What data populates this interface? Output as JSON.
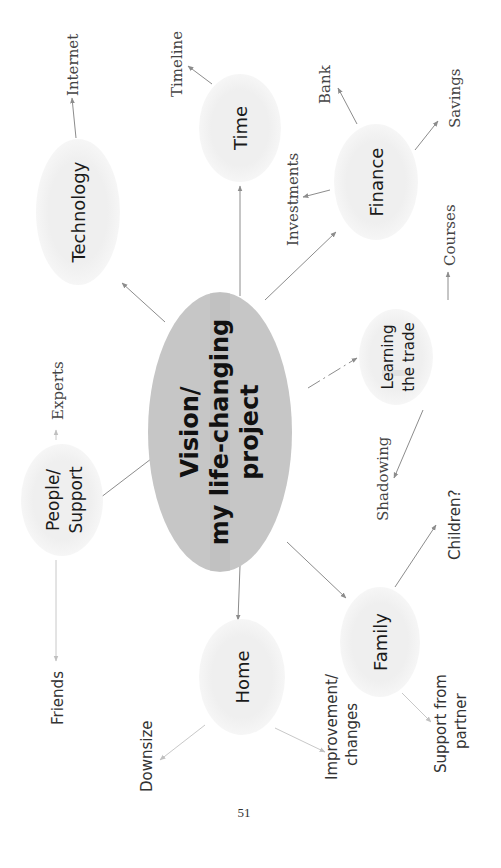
{
  "center": {
    "lines": [
      "Vision/",
      "my life-changing",
      "project"
    ],
    "fill": "#c6c6c6"
  },
  "nodes": {
    "technology": {
      "label": "Technology"
    },
    "time": {
      "label": "Time"
    },
    "finance": {
      "label": "Finance"
    },
    "learning": {
      "lines": [
        "Learning",
        "the trade"
      ]
    },
    "people": {
      "lines": [
        "People/",
        "Support"
      ]
    },
    "home": {
      "label": "Home"
    },
    "family": {
      "label": "Family"
    }
  },
  "leaves": {
    "internet": "Internet",
    "timeline": "Timeline",
    "bank": "Bank",
    "savings": "Savings",
    "investments": "Investments",
    "courses": "Courses",
    "shadowing": "Shadowing",
    "experts": "Experts",
    "friends": "Friends",
    "downsize": "Downsize",
    "improvement": [
      "Improvement/",
      "changes"
    ],
    "support_partner": [
      "Support from",
      "partner"
    ],
    "children": "Children?"
  },
  "colors": {
    "node_fill": "#efefef",
    "center_fill": "#c6c6c6",
    "edge": "#8c8c8c"
  },
  "page_number": "51"
}
